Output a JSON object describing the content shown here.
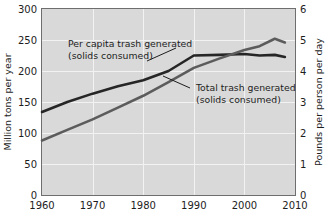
{
  "chart_data": {
    "type": "line",
    "title": "",
    "xlabel": "",
    "ylabel": "Million tons per year",
    "ylabel_right": "Pounds per person per day",
    "xlim": [
      1960,
      2010
    ],
    "ylim": [
      0,
      300
    ],
    "ylim_right": [
      0,
      6
    ],
    "xticks": [
      1960,
      1970,
      1980,
      1990,
      2000,
      2010
    ],
    "xticklabels": [
      "1960",
      "1970",
      "1980",
      "1990",
      "2000",
      "2010"
    ],
    "yticks": [
      0,
      50,
      100,
      150,
      200,
      250,
      300
    ],
    "yticklabels": [
      "0",
      "50",
      "100",
      "150",
      "200",
      "250",
      "300"
    ],
    "yticks_right": [
      0,
      1,
      2,
      3,
      4,
      5,
      6
    ],
    "yticklabels_right": [
      "0",
      "1",
      "2",
      "3",
      "4",
      "5",
      "6"
    ],
    "grid": true,
    "grid_color": "#f2f2f2",
    "plot_background": "#d9d9d9",
    "legend_position": "inline-annotations",
    "series": [
      {
        "name": "Per capita trash generated (solids consumed)",
        "axis": "right",
        "units": "Pounds per person per day",
        "color": "#262626",
        "x": [
          1960,
          1965,
          1970,
          1975,
          1980,
          1985,
          1990,
          1995,
          2000,
          2003,
          2006,
          2008
        ],
        "values": [
          2.68,
          3.0,
          3.27,
          3.51,
          3.7,
          4.0,
          4.5,
          4.52,
          4.55,
          4.5,
          4.52,
          4.45
        ]
      },
      {
        "name": "Total trash generated (solids consumed)",
        "axis": "left",
        "units": "Million tons per year",
        "color": "#5c5c5c",
        "x": [
          1960,
          1965,
          1970,
          1975,
          1980,
          1985,
          1990,
          1995,
          2000,
          2003,
          2006,
          2008
        ],
        "values": [
          88,
          105,
          122,
          141,
          160,
          182,
          205,
          220,
          234,
          240,
          252,
          246
        ]
      }
    ],
    "annotations": [
      {
        "id": "per-capita-annotation",
        "line1": "Per capita trash generated",
        "line2": "(solids consumed)",
        "leader_from": [
          147,
          61
        ],
        "leader_to": [
          176,
          48
        ]
      },
      {
        "id": "total-trash-annotation",
        "line1": "Total trash generated",
        "line2": "(solids consumed)",
        "leader_from": [
          190,
          88
        ],
        "leader_to": [
          163,
          76
        ]
      }
    ]
  }
}
